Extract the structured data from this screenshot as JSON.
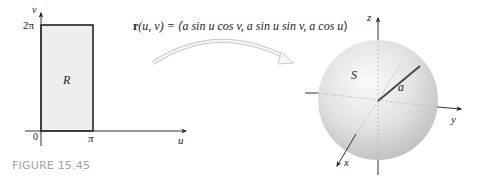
{
  "caption": "FIGURE 15.45",
  "left_panel": {
    "axis_v_label": "v",
    "axis_u_label": "u",
    "tick_top": "2π",
    "tick_origin": "0",
    "tick_right": "π",
    "region_label": "R",
    "region_fill": "#eeeeee"
  },
  "mapping": {
    "formula_func": "r",
    "formula_args": "(u, v) = ⟨",
    "formula_body": "a sin u cos v, a sin u sin v, a cos u",
    "formula_close": "⟩"
  },
  "right_panel": {
    "axis_x_label": "x",
    "axis_y_label": "y",
    "axis_z_label": "z",
    "surface_label": "S",
    "radius_label": "a",
    "sphere_color": "#d9d9d9"
  }
}
